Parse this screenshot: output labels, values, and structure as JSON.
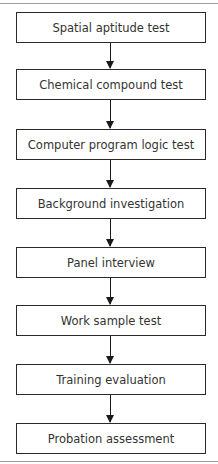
{
  "flowchart": {
    "direction": "top-to-bottom",
    "steps": [
      {
        "label": "Spatial aptitude test"
      },
      {
        "label": "Chemical compound test"
      },
      {
        "label": "Computer program logic test"
      },
      {
        "label": "Background investigation"
      },
      {
        "label": "Panel interview"
      },
      {
        "label": "Work sample test"
      },
      {
        "label": "Training evaluation"
      },
      {
        "label": "Probation assessment"
      }
    ],
    "colors": {
      "border": "#2a2a2a",
      "text": "#333333",
      "arrow": "#1a1a1a",
      "rule": "#9a9a9a"
    }
  }
}
